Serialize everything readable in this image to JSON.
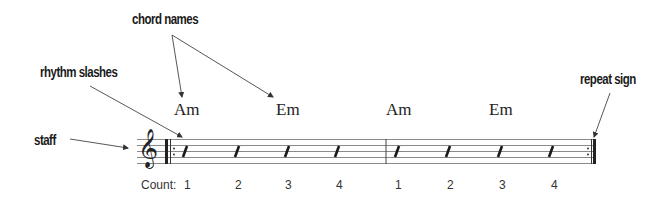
{
  "diagram": {
    "callouts": {
      "chord_names": "chord names",
      "rhythm_slashes": "rhythm slashes",
      "staff": "staff",
      "repeat_sign": "repeat sign"
    },
    "chords": [
      {
        "name": "Am",
        "measure": 1,
        "beat": 1
      },
      {
        "name": "Em",
        "measure": 1,
        "beat": 3
      },
      {
        "name": "Am",
        "measure": 2,
        "beat": 1
      },
      {
        "name": "Em",
        "measure": 2,
        "beat": 3
      }
    ],
    "count_label": "Count:",
    "counts": [
      "1",
      "2",
      "3",
      "4",
      "1",
      "2",
      "3",
      "4"
    ],
    "clef_glyph": "𝄞",
    "clef_icon": "treble-clef-icon",
    "slash_count": 8,
    "measures": 2,
    "staff_lines": 5,
    "colors": {
      "ink": "#222222",
      "staff_line": "#888888",
      "background": "#ffffff"
    }
  }
}
